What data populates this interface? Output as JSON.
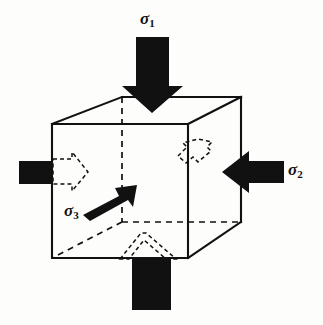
{
  "figure": {
    "background_color": "#fdfdfc",
    "ink_color": "#111111",
    "labels": {
      "sigma1": {
        "symbol": "σ",
        "subscript": "1",
        "full": "σ1",
        "role": "major-principal-stress-label"
      },
      "sigma2": {
        "symbol": "σ",
        "subscript": "2",
        "full": "σ2",
        "role": "intermediate-principal-stress-label"
      },
      "sigma3": {
        "symbol": "σ",
        "subscript": "3",
        "full": "σ3",
        "role": "minor-principal-stress-label"
      }
    },
    "elements": {
      "cube": {
        "name": "cube-element",
        "front_face": {
          "left": 52,
          "top": 124,
          "right": 188,
          "bottom": 258
        },
        "depth_offset": {
          "dx": 53,
          "dy": -28
        },
        "visible_edge_color": "#111111",
        "hidden_edge_color": "#111111",
        "hidden_edge_style": "dashed",
        "fill": "none"
      },
      "solid_arrows": [
        {
          "name": "sigma1-arrow",
          "direction": "down",
          "label": "σ1",
          "color": "#111111"
        },
        {
          "name": "sigma2-arrow",
          "direction": "left",
          "label": "σ2",
          "color": "#111111"
        },
        {
          "name": "sigma3-arrow",
          "direction": "up-right",
          "label": "σ3",
          "color": "#111111"
        },
        {
          "name": "sigma1-reaction-block",
          "direction": "up",
          "label": "",
          "color": "#111111"
        },
        {
          "name": "sigma2-reaction-block",
          "direction": "right",
          "label": "",
          "color": "#111111"
        }
      ],
      "dashed_arrows": [
        {
          "name": "left-face-expansion-arrow",
          "direction": "right",
          "color": "#111111"
        },
        {
          "name": "back-face-expansion-arrow",
          "direction": "up-left",
          "color": "#111111"
        },
        {
          "name": "bottom-face-expansion-arrow",
          "direction": "up",
          "color": "#111111"
        }
      ]
    }
  }
}
